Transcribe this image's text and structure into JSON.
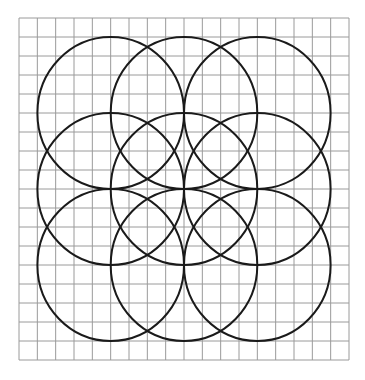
{
  "diagram": {
    "type": "overlapping-circles-on-grid",
    "grid": {
      "x0": 19,
      "y0": 18,
      "x1": 349,
      "y1": 360,
      "cols": 18,
      "rows": 18,
      "line_color": "#9a9a9a",
      "line_width": 1
    },
    "circles": {
      "stroke": "#1a1a1a",
      "stroke_width": 2,
      "rx": 73.3,
      "ry": 76,
      "centers": [
        {
          "cx": 110.7,
          "cy": 113
        },
        {
          "cx": 184.0,
          "cy": 113
        },
        {
          "cx": 257.3,
          "cy": 113
        },
        {
          "cx": 110.7,
          "cy": 189
        },
        {
          "cx": 184.0,
          "cy": 189
        },
        {
          "cx": 257.3,
          "cy": 189
        },
        {
          "cx": 110.7,
          "cy": 265
        },
        {
          "cx": 184.0,
          "cy": 265
        },
        {
          "cx": 257.3,
          "cy": 265
        }
      ]
    }
  }
}
